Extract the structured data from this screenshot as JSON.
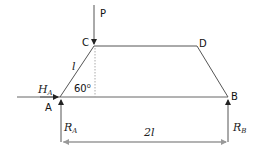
{
  "diagram": {
    "type": "statics-trapezoid-frame",
    "points": {
      "A": {
        "label": "A"
      },
      "B": {
        "label": "B"
      },
      "C": {
        "label": "C"
      },
      "D": {
        "label": "D"
      }
    },
    "load": {
      "label": "P"
    },
    "member_length": {
      "label": "l"
    },
    "angle": {
      "label": "60⁰"
    },
    "reactions": {
      "HA": {
        "main": "H",
        "sub": "A"
      },
      "RA": {
        "main": "R",
        "sub": "A"
      },
      "RB": {
        "main": "R",
        "sub": "B"
      }
    },
    "span": {
      "label": "2l"
    },
    "colors": {
      "line": "#555555",
      "dim": "#888888",
      "arrow": "#222222"
    }
  }
}
